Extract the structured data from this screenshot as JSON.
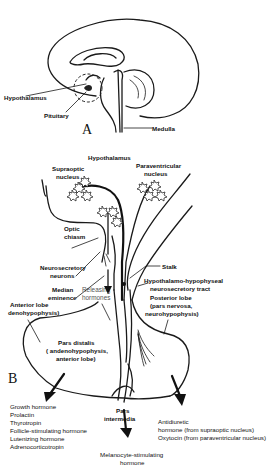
{
  "panel_a": {
    "letter": "A",
    "labels": {
      "hypothalamus": "Hypothalamus",
      "pituitary": "Pituitary",
      "medulla": "Medulla"
    }
  },
  "panel_b": {
    "letter": "B",
    "labels": {
      "hypothalamus": "Hypothalamus",
      "supraoptic_1": "Supraoptic",
      "supraoptic_2": "nucleus",
      "paraventricular_1": "Paraventricular",
      "paraventricular_2": "nucleus",
      "optic_1": "Optic",
      "optic_2": "chiasm",
      "neurosecretory_1": "Neurosecretory",
      "neurosecretory_2": "neurons",
      "median_1": "Median",
      "median_2": "eminence",
      "releasing_1": "Releasing",
      "releasing_2": "hormones",
      "stalk": "Stalk",
      "tract_1": "Hypothalamo-hypophyseal",
      "tract_2": "neurosecretory tract",
      "anterior_1": "Anterior lobe",
      "anterior_2": "denohypophysis)",
      "posterior_1": "Posterior lobe",
      "posterior_2": "(pars nervosa,",
      "posterior_3": "neurohypophysis)",
      "distalis_1": "Pars distalis",
      "distalis_2": "( andenohypophysis,",
      "distalis_3": "anterior lobe)",
      "intermedia_1": "Pars",
      "intermedia_2": "intermedia"
    },
    "anterior_hormones": [
      "Growth hormone",
      "Prolactin",
      "Thyrotropin",
      "Follicle-stimulating hormone",
      "Lutenizing hormone",
      "Adrenocorticotropin"
    ],
    "intermedia_hormone": [
      "Melanocyte-stimulating",
      "hormone"
    ],
    "posterior_hormones": [
      "Antidiuretic",
      "hormone (from supraoptic nucleus)",
      "Oxytocin (from paraventricular nucleus)"
    ]
  }
}
